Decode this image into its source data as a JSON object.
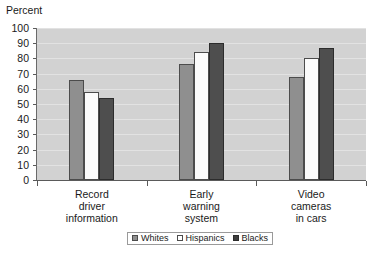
{
  "chart_data": {
    "type": "bar",
    "title": "",
    "ylabel": "Percent",
    "xlabel": "",
    "ylim": [
      0,
      100
    ],
    "ytick_step": 10,
    "ytick_labels": [
      "100",
      "90",
      "80",
      "70",
      "60",
      "50",
      "40",
      "30",
      "20",
      "10",
      "0"
    ],
    "grid": true,
    "legend_position": "bottom",
    "categories": [
      "Record\ndriver\ninformation",
      "Early\nwarning\nsystem",
      "Video\ncameras\nin cars"
    ],
    "category_lines": [
      [
        "Record",
        "driver",
        "information"
      ],
      [
        "Early",
        "warning",
        "system"
      ],
      [
        "Video",
        "cameras",
        "in cars"
      ]
    ],
    "series": [
      {
        "name": "Whites",
        "color": "#8f8f8f",
        "values": [
          66,
          76,
          68
        ]
      },
      {
        "name": "Hispanics",
        "color": "#fbfbfb",
        "values": [
          58,
          84,
          80
        ]
      },
      {
        "name": "Blacks",
        "color": "#4e4e4e",
        "values": [
          54,
          90,
          87
        ]
      }
    ]
  },
  "colors": {
    "plot_background": "#d2d2d2",
    "gridline": "#e2e2e2",
    "axis": "#5a5a5a",
    "text": "#1a1a1a",
    "page_background": "#ffffff"
  }
}
